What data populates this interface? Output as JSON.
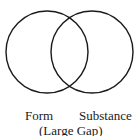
{
  "diagram": {
    "type": "venn",
    "circles": [
      {
        "name": "form-circle",
        "cx": 47,
        "cy": 52,
        "r": 41
      },
      {
        "name": "substance-circle",
        "cx": 92,
        "cy": 52,
        "r": 41
      }
    ],
    "stroke_color": "#1a1a1a",
    "labels": {
      "left": "Form",
      "right": "Substance",
      "caption": "(Large Gap)"
    }
  }
}
